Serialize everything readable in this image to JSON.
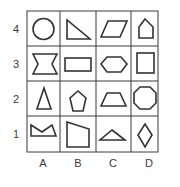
{
  "grid": {
    "rows": [
      "4",
      "3",
      "2",
      "1"
    ],
    "columns": [
      "A",
      "B",
      "C",
      "D"
    ],
    "line_color": "#3a3a3a",
    "shape_color": "#333333",
    "cells": [
      {
        "col": "A",
        "row": "4",
        "shape": "circle"
      },
      {
        "col": "B",
        "row": "4",
        "shape": "right-triangle"
      },
      {
        "col": "C",
        "row": "4",
        "shape": "parallelogram"
      },
      {
        "col": "D",
        "row": "4",
        "shape": "pentagon-house"
      },
      {
        "col": "A",
        "row": "3",
        "shape": "bowtie-hourglass"
      },
      {
        "col": "B",
        "row": "3",
        "shape": "rectangle"
      },
      {
        "col": "C",
        "row": "3",
        "shape": "hexagon"
      },
      {
        "col": "D",
        "row": "3",
        "shape": "square"
      },
      {
        "col": "A",
        "row": "2",
        "shape": "isosceles-triangle"
      },
      {
        "col": "B",
        "row": "2",
        "shape": "pentagon"
      },
      {
        "col": "C",
        "row": "2",
        "shape": "trapezoid"
      },
      {
        "col": "D",
        "row": "2",
        "shape": "octagon"
      },
      {
        "col": "A",
        "row": "1",
        "shape": "notched-crown"
      },
      {
        "col": "B",
        "row": "1",
        "shape": "irregular-quadrilateral"
      },
      {
        "col": "C",
        "row": "1",
        "shape": "obtuse-triangle"
      },
      {
        "col": "D",
        "row": "1",
        "shape": "rhombus"
      }
    ]
  }
}
